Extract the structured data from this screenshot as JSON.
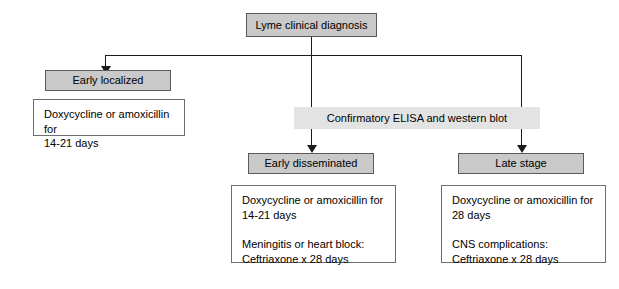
{
  "diagram": {
    "colors": {
      "node_fill": "#c9c9c9",
      "band_fill": "#e3e3e3",
      "box_fill": "#ffffff",
      "border": "#5a5a5a",
      "connector": "#1c1c1c",
      "background": "#ffffff",
      "text": "#000000"
    },
    "nodes": {
      "root": {
        "label": "Lyme clinical diagnosis"
      },
      "early_localized": {
        "label": "Early localized"
      },
      "early_localized_treatment": {
        "label": "Doxycycline or amoxicillin for\n14-21 days"
      },
      "confirmatory_test": {
        "label": "Confirmatory ELISA and western blot"
      },
      "early_disseminated": {
        "label": "Early disseminated"
      },
      "early_disseminated_treatment": {
        "label": "Doxycycline or amoxicillin for\n14-21 days\n\nMeningitis or heart block:\n    Ceftriaxone x 28 days"
      },
      "late_stage": {
        "label": "Late stage"
      },
      "late_stage_treatment": {
        "label": "Doxycycline or amoxicillin for\n28 days\n\nCNS complications:\n    Ceftriaxone x 28 days"
      }
    }
  }
}
